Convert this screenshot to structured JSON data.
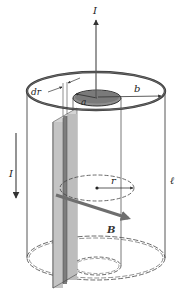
{
  "diagram": {
    "type": "coaxial-cable-ampere-law",
    "labels": {
      "current_top": "I",
      "current_side": "I",
      "shell_thickness": "dr",
      "outer_radius": "b",
      "inner_radius": "a",
      "amperian_radius": "r",
      "field": "B",
      "length": "ℓ"
    },
    "colors": {
      "line": "#333333",
      "rim": "#3a3a3a",
      "inner_top_fill": "#8c8c8c",
      "slab_light": "#c8c8c8",
      "slab_dark": "#8a8a8a",
      "field_arrow": "#6e6e6e",
      "background": "#ffffff"
    }
  }
}
